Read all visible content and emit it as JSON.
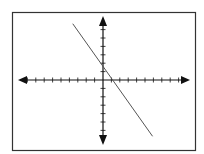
{
  "chart_data": {
    "type": "line",
    "title": "",
    "xlabel": "",
    "ylabel": "",
    "grid": false,
    "axes_style": "cartesian-arrows-with-ticks",
    "xlim": [
      -10,
      10
    ],
    "ylim": [
      -7,
      7
    ],
    "x_tick_step": 1,
    "y_tick_step": 1,
    "series": [
      {
        "name": "line",
        "equation": "y = -1.5x + 1.5",
        "slope": -1.5,
        "y_intercept": 1.5,
        "x_intercept": 1,
        "x": [
          -3.6,
          5.9
        ],
        "y": [
          6.7,
          -6.7
        ]
      }
    ]
  },
  "colors": {
    "frame": "#333333",
    "axis": "#111111",
    "line": "#555555",
    "background": "#ffffff"
  }
}
